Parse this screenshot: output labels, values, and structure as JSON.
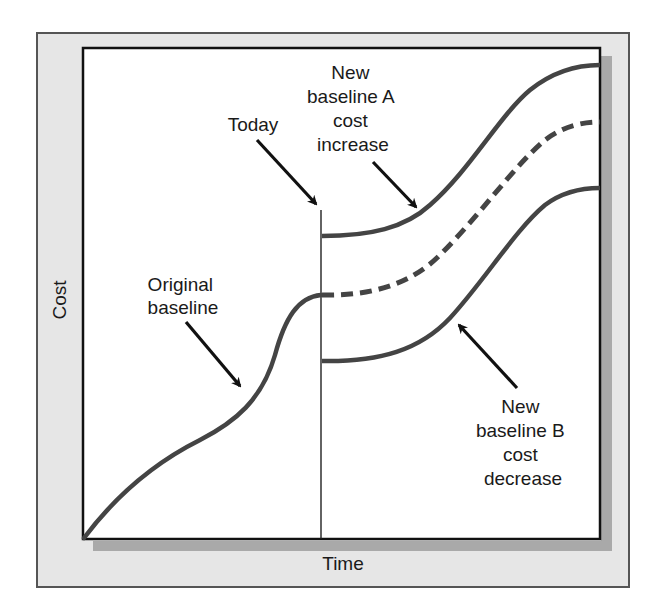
{
  "diagram": {
    "type": "line-schematic",
    "axes": {
      "x_label": "Time",
      "y_label": "Cost"
    },
    "markers": {
      "today_label": "Today"
    },
    "annotations": {
      "original": [
        "Original",
        "baseline"
      ],
      "new_a": [
        "New",
        "baseline A",
        "cost",
        "increase"
      ],
      "new_b": [
        "New",
        "baseline B",
        "cost",
        "decrease"
      ]
    },
    "series": [
      {
        "name": "Original baseline",
        "style": "solid",
        "segment": "before today"
      },
      {
        "name": "Original baseline (projected)",
        "style": "dashed",
        "segment": "after today"
      },
      {
        "name": "New baseline A cost increase",
        "style": "solid",
        "segment": "after today"
      },
      {
        "name": "New baseline B cost decrease",
        "style": "solid",
        "segment": "after today"
      }
    ],
    "colors": {
      "frame_fill": "#e6e6e6",
      "frame_border": "#555555",
      "plot_fill": "#ffffff",
      "shadow": "#a9a9a9",
      "curve": "#444444",
      "text": "#1a1a1a"
    }
  }
}
